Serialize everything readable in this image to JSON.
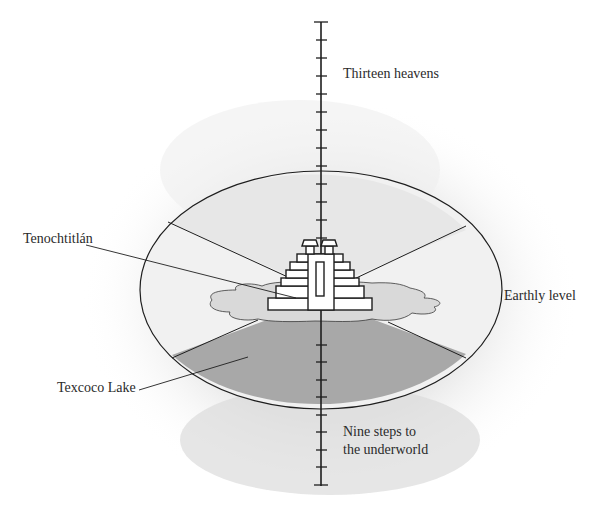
{
  "diagram": {
    "type": "cosmology-illustration",
    "labels": {
      "top": "Thirteen heavens",
      "city": "Tenochtitlán",
      "earth": "Earthly level",
      "lake": "Texcoco Lake",
      "bottom_line1": "Nine steps to",
      "bottom_line2": "the underworld"
    },
    "axis": {
      "upper_ticks": 13,
      "lower_ticks": 9
    },
    "colors": {
      "background": "#ffffff",
      "wash": "#e6e6e6",
      "ellipse_fill": "#f0f0f0",
      "lake_fill": "#d8d8d8",
      "lower_sector": "#a9a9a9",
      "line": "#1e1e1e",
      "text": "#2a2a2a"
    }
  }
}
